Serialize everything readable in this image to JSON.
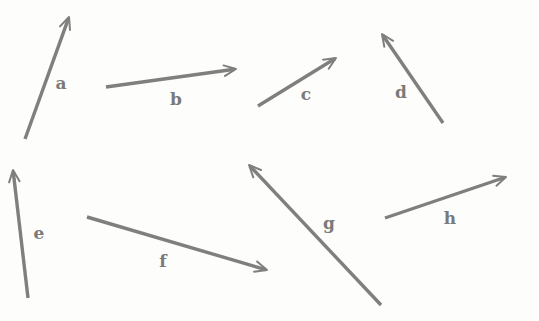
{
  "diagram": {
    "type": "vector-set",
    "colors": {
      "arrow": "#7f7f7f",
      "label": "#7a7a7a",
      "background": "#fdfdfc"
    },
    "vectors": [
      {
        "label": "a",
        "x1": 25,
        "y1": 139,
        "x2": 69,
        "y2": 17,
        "lx": 61,
        "ly": 89
      },
      {
        "label": "b",
        "x1": 106,
        "y1": 87,
        "x2": 236,
        "y2": 69,
        "lx": 176,
        "ly": 105
      },
      {
        "label": "c",
        "x1": 258,
        "y1": 106,
        "x2": 336,
        "y2": 58,
        "lx": 306,
        "ly": 100
      },
      {
        "label": "d",
        "x1": 443,
        "y1": 123,
        "x2": 382,
        "y2": 34,
        "lx": 401,
        "ly": 98
      },
      {
        "label": "e",
        "x1": 28,
        "y1": 298,
        "x2": 13,
        "y2": 170,
        "lx": 39,
        "ly": 239
      },
      {
        "label": "f",
        "x1": 87,
        "y1": 217,
        "x2": 267,
        "y2": 270,
        "lx": 163,
        "ly": 267
      },
      {
        "label": "g",
        "x1": 381,
        "y1": 305,
        "x2": 249,
        "y2": 165,
        "lx": 329,
        "ly": 229
      },
      {
        "label": "h",
        "x1": 385,
        "y1": 218,
        "x2": 506,
        "y2": 177,
        "lx": 450,
        "ly": 224
      }
    ]
  }
}
